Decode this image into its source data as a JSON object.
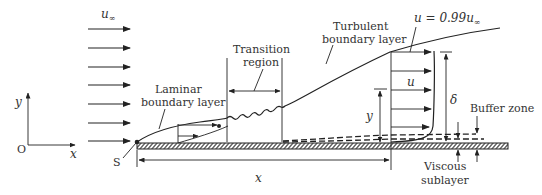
{
  "labels": {
    "freestream_velocity": "u∞",
    "freestream_u": "u",
    "freestream_sub": "∞",
    "laminar_line1": "Laminar",
    "laminar_line2": "boundary layer",
    "transition_line1": "Transition",
    "transition_line2": "region",
    "turbulent_line1": "Turbulent",
    "turbulent_line2": "boundary layer",
    "edge_condition_prefix": "u = 0.99u",
    "edge_condition_sub": "∞",
    "velocity_u": "u",
    "delta": "δ",
    "y_dim": "y",
    "x_dim": "x",
    "buffer_zone": "Buffer zone",
    "viscous_line1": "Viscous",
    "viscous_line2": "sublayer",
    "leading_edge": "S",
    "origin": "O",
    "axis_x": "x",
    "axis_y": "y"
  },
  "freestream_arrows": 7,
  "colors": {
    "line": "#222222",
    "text": "#333333",
    "background": "#ffffff"
  }
}
